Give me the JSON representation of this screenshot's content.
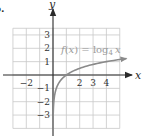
{
  "problem": {
    "part_label": "b."
  },
  "chart_data": {
    "type": "line",
    "title": "",
    "function_label": "f(x) = log₄ x",
    "function_label_parts": {
      "lhs": "f(x) = log",
      "base": "4",
      "arg": "x"
    },
    "xlabel": "x",
    "ylabel": "y",
    "xlim": [
      -3,
      5
    ],
    "ylim": [
      -4,
      3.5
    ],
    "grid": true,
    "x_ticks": [
      {
        "value": -2,
        "label": "−2"
      },
      {
        "value": 2,
        "label": "2"
      },
      {
        "value": 3,
        "label": "3"
      },
      {
        "value": 4,
        "label": "4"
      }
    ],
    "y_ticks": [
      {
        "value": 3,
        "label": "3"
      },
      {
        "value": 2,
        "label": "2"
      },
      {
        "value": 1,
        "label": "1"
      },
      {
        "value": -1,
        "label": "−1"
      },
      {
        "value": -2,
        "label": "−2"
      },
      {
        "value": -3,
        "label": "−3"
      }
    ],
    "series": [
      {
        "name": "f(x) = log₄ x",
        "color": "#8a8a8a",
        "x": [
          0.0156,
          0.0625,
          0.25,
          0.5,
          1,
          2,
          3,
          4,
          5.5
        ],
        "y": [
          -3,
          -2,
          -1,
          -0.5,
          0,
          0.5,
          0.79,
          1,
          1.23
        ]
      }
    ],
    "key_points": [
      {
        "x": 0.25,
        "y": -1
      },
      {
        "x": 1,
        "y": 0
      },
      {
        "x": 4,
        "y": 1
      }
    ],
    "asymptote": {
      "type": "vertical",
      "x": 0
    }
  },
  "colors": {
    "axis": "#2a2a2a",
    "grid": "#c8c8c8",
    "curve": "#8a8a8a",
    "label": "#9a9a9a"
  }
}
